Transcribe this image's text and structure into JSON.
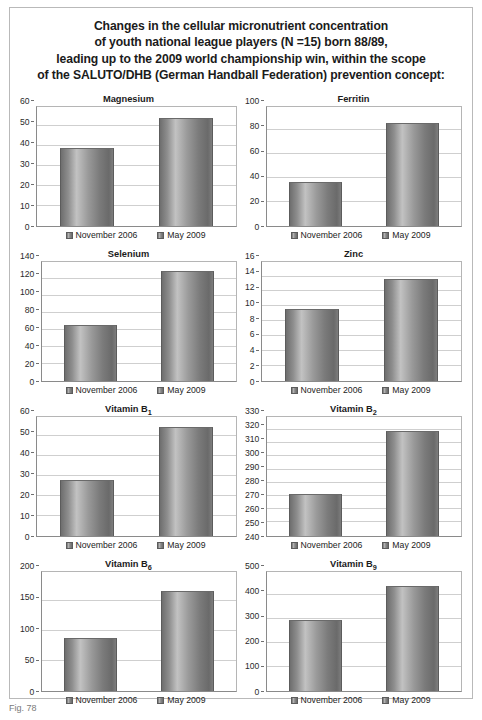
{
  "figure": {
    "title_lines": [
      "Changes in the cellular micronutrient concentration",
      "of youth national league players (N =15) born 88/89,",
      "leading up to the 2009 world championship win, within the scope",
      "of the SALUTO/DHB (German Handball Federation) prevention concept:"
    ],
    "caption": "Fig. 78"
  },
  "legend": {
    "series": [
      {
        "label": "November 2006",
        "swatch": "bar-swatch-icon"
      },
      {
        "label": "May 2009",
        "swatch": "bar-swatch-icon"
      }
    ]
  },
  "chart_data": [
    {
      "type": "bar",
      "title": "Magnesium",
      "title_base": "Magnesium",
      "title_sub": "",
      "categories": [
        "November 2006",
        "May 2009"
      ],
      "values": [
        39,
        54.5
      ],
      "xlabel": "",
      "ylabel": "",
      "ylim": [
        0,
        60
      ],
      "yticks": [
        0,
        10,
        20,
        30,
        40,
        50,
        60
      ],
      "grid": true,
      "legend_position": "bottom"
    },
    {
      "type": "bar",
      "title": "Ferritin",
      "title_base": "Ferritin",
      "title_sub": "",
      "categories": [
        "November 2006",
        "May 2009"
      ],
      "values": [
        37,
        86
      ],
      "xlabel": "",
      "ylabel": "",
      "ylim": [
        0,
        100
      ],
      "yticks": [
        0,
        20,
        40,
        60,
        80,
        100
      ],
      "grid": true,
      "legend_position": "bottom"
    },
    {
      "type": "bar",
      "title": "Selenium",
      "title_base": "Selenium",
      "title_sub": "",
      "categories": [
        "November 2006",
        "May 2009"
      ],
      "values": [
        66,
        129
      ],
      "xlabel": "",
      "ylabel": "",
      "ylim": [
        0,
        140
      ],
      "yticks": [
        0,
        20,
        40,
        60,
        80,
        100,
        120,
        140
      ],
      "grid": true,
      "legend_position": "bottom"
    },
    {
      "type": "bar",
      "title": "Zinc",
      "title_base": "Zinc",
      "title_sub": "",
      "categories": [
        "November 2006",
        "May 2009"
      ],
      "values": [
        9.6,
        13.7
      ],
      "xlabel": "",
      "ylabel": "",
      "ylim": [
        0,
        16
      ],
      "yticks": [
        0,
        2,
        4,
        6,
        8,
        10,
        12,
        14,
        16
      ],
      "grid": true,
      "legend_position": "bottom"
    },
    {
      "type": "bar",
      "title": "Vitamin B1",
      "title_base": "Vitamin B",
      "title_sub": "1",
      "categories": [
        "November 2006",
        "May 2009"
      ],
      "values": [
        28,
        55
      ],
      "xlabel": "",
      "ylabel": "",
      "ylim": [
        0,
        60
      ],
      "yticks": [
        0,
        10,
        20,
        30,
        40,
        50,
        60
      ],
      "grid": true,
      "legend_position": "bottom"
    },
    {
      "type": "bar",
      "title": "Vitamin B2",
      "title_base": "Vitamin B",
      "title_sub": "2",
      "categories": [
        "November 2006",
        "May 2009"
      ],
      "values": [
        271.5,
        319.5
      ],
      "xlabel": "",
      "ylabel": "",
      "ylim": [
        240,
        330
      ],
      "yticks": [
        240,
        250,
        260,
        270,
        280,
        290,
        300,
        310,
        320,
        330
      ],
      "grid": true,
      "legend_position": "bottom"
    },
    {
      "type": "bar",
      "title": "Vitamin B6",
      "title_base": "Vitamin B",
      "title_sub": "6",
      "categories": [
        "November 2006",
        "May 2009"
      ],
      "values": [
        89,
        167
      ],
      "xlabel": "",
      "ylabel": "",
      "ylim": [
        0,
        200
      ],
      "yticks": [
        0,
        50,
        100,
        150,
        200
      ],
      "grid": true,
      "legend_position": "bottom"
    },
    {
      "type": "bar",
      "title": "Vitamin B9",
      "title_base": "Vitamin B",
      "title_sub": "9",
      "categories": [
        "November 2006",
        "May 2009"
      ],
      "values": [
        298,
        438
      ],
      "xlabel": "",
      "ylabel": "",
      "ylim": [
        0,
        500
      ],
      "yticks": [
        0,
        100,
        200,
        300,
        400,
        500
      ],
      "grid": true,
      "legend_position": "bottom"
    }
  ]
}
